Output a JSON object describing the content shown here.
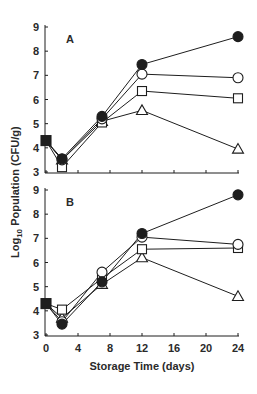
{
  "chart_data": {
    "type": "line",
    "title": "",
    "xlabel": "Storage Time (days)",
    "ylabel": "Log10 Population (CFU/g)",
    "ylabel_parts": {
      "prefix": "Log",
      "subscript": "10",
      "suffix": " Population (CFU/g)"
    },
    "x_ticks": [
      0,
      4,
      8,
      12,
      16,
      20,
      24
    ],
    "y_ticks": [
      3,
      4,
      5,
      6,
      7,
      8,
      9
    ],
    "xlim": [
      0,
      24
    ],
    "ylim": [
      3,
      9
    ],
    "grid": false,
    "legend": null,
    "x": [
      0,
      2,
      7,
      12,
      24
    ],
    "panels": [
      {
        "label": "A",
        "series": [
          {
            "name": "filled-circle",
            "marker": "circle",
            "filled": true,
            "values": [
              4.3,
              3.55,
              5.3,
              7.45,
              8.6
            ]
          },
          {
            "name": "open-circle",
            "marker": "circle",
            "filled": false,
            "values": [
              4.3,
              3.5,
              5.2,
              7.05,
              6.9
            ]
          },
          {
            "name": "open-square",
            "marker": "square",
            "filled": false,
            "values": [
              4.3,
              3.2,
              5.05,
              6.35,
              6.05
            ]
          },
          {
            "name": "open-triangle",
            "marker": "triangle",
            "filled": false,
            "values": [
              4.3,
              3.5,
              5.1,
              5.55,
              3.95
            ]
          }
        ]
      },
      {
        "label": "B",
        "series": [
          {
            "name": "filled-circle",
            "marker": "circle",
            "filled": true,
            "values": [
              4.3,
              3.45,
              5.2,
              7.2,
              8.8
            ]
          },
          {
            "name": "open-circle",
            "marker": "circle",
            "filled": false,
            "values": [
              4.3,
              3.55,
              5.6,
              7.05,
              6.75
            ]
          },
          {
            "name": "open-square",
            "marker": "square",
            "filled": false,
            "values": [
              4.3,
              4.05,
              5.35,
              6.55,
              6.6
            ]
          },
          {
            "name": "open-triangle",
            "marker": "triangle",
            "filled": false,
            "values": [
              4.3,
              3.7,
              5.1,
              6.2,
              4.6
            ]
          }
        ]
      }
    ],
    "initial_point": {
      "x": 0,
      "y": 4.3,
      "marker": "square",
      "filled": true
    }
  },
  "colors": {
    "ink": "#1e1e1e",
    "background": "#ffffff"
  }
}
